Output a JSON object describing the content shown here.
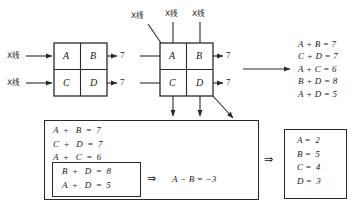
{
  "figure": {
    "title_cut": "",
    "xray_label": "X线",
    "output_value": "7",
    "implies_symbol": "⇒",
    "left_grid": {
      "name": "left-grid",
      "cells": [
        [
          "A",
          "B"
        ],
        [
          "C",
          "D"
        ]
      ],
      "left_inputs": [
        "X线",
        "X线"
      ],
      "right_outputs": [
        "7",
        "7"
      ]
    },
    "middle_grid": {
      "name": "middle-grid",
      "cells": [
        [
          "A",
          "B"
        ],
        [
          "C",
          "D"
        ]
      ],
      "top_inputs": [
        "X线",
        "X线",
        "X线"
      ],
      "right_outputs": [
        "7",
        "7"
      ]
    },
    "equations_panel": {
      "name": "equations-list",
      "lines": [
        "A + B = 7",
        "C + D = 7",
        "A + C = 6",
        "B + D = 8",
        "A + D = 5"
      ]
    },
    "system_matrix": {
      "name": "system-of-equations-matrix",
      "outer_rows": [
        "A  +   B  =  7",
        "C  +   D  =  7",
        "A  +   C  =  6"
      ],
      "inner_rows": [
        "B  +   D  =  8",
        "A  +   D  =  5"
      ],
      "inner_implies": "⇒",
      "derived": "A − B = −3"
    },
    "solution_matrix": {
      "name": "solution-matrix",
      "implies": "⇒",
      "rows": [
        "A =  2",
        "B =  5",
        "C =  4",
        "D =  3"
      ]
    },
    "colors": {
      "stroke": "#2a2a2a",
      "grid_fill": "#ffffff",
      "text": "#1a1a1a",
      "background": "#ffffff"
    }
  }
}
